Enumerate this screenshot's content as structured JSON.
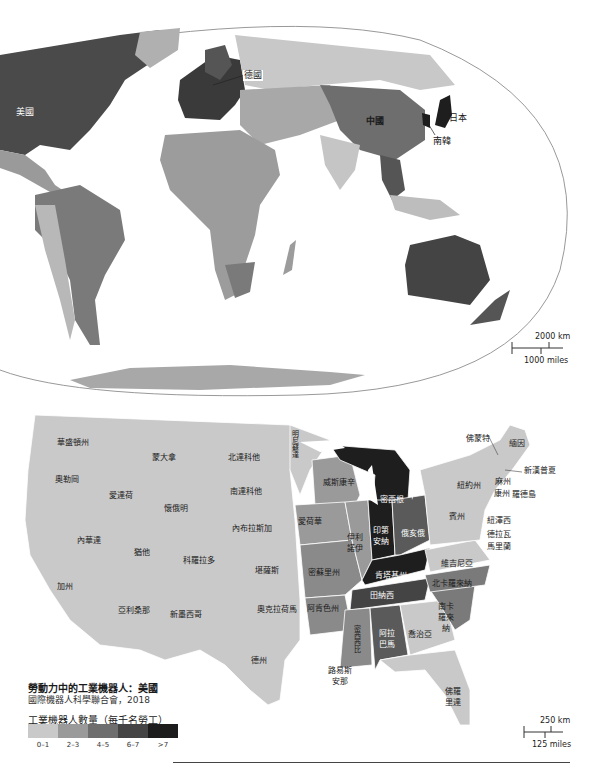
{
  "world_map": {
    "labels": {
      "usa": "美國",
      "germany": "德國",
      "china": "中國",
      "japan": "日本",
      "south_korea": "南韓"
    },
    "scale": {
      "km": "2000 km",
      "miles": "1000 miles"
    }
  },
  "us_map": {
    "states": {
      "washington": "華盛頓州",
      "oregon": "奧勒岡",
      "idaho": "愛達荷",
      "montana": "蒙大拿",
      "wyoming": "懷俄明",
      "nevada": "內華達",
      "utah": "猶他",
      "colorado": "科羅拉多",
      "california": "加州",
      "arizona": "亞利桑那",
      "new_mexico": "新墨西哥",
      "north_dakota": "北達科他",
      "south_dakota": "南達科他",
      "nebraska": "內布拉斯加",
      "kansas": "堪薩斯",
      "oklahoma": "奧克拉荷馬",
      "texas": "德州",
      "minnesota": "明尼蘇達",
      "iowa": "愛荷華",
      "missouri": "密蘇里州",
      "arkansas": "阿肯色州",
      "louisiana": "路易斯安那",
      "wisconsin": "威斯康辛",
      "illinois": "伊利諾伊",
      "michigan": "密西根",
      "indiana": "印第安納",
      "ohio": "俄亥俄",
      "kentucky": "肯塔基州",
      "tennessee": "田納西",
      "mississippi": "密西西比",
      "alabama": "阿拉巴馬",
      "georgia": "喬治亞",
      "florida": "佛羅里達",
      "south_carolina": "南卡羅來納",
      "north_carolina": "北卡羅來納",
      "virginia": "維吉尼亞",
      "pennsylvania": "賓州",
      "new_york": "紐約州",
      "vermont": "佛蒙特",
      "maine": "緬因",
      "new_hampshire": "新漢普夏",
      "massachusetts": "麻州",
      "connecticut": "康州",
      "rhode_island": "羅德島",
      "new_jersey": "紐澤西",
      "delaware": "德拉瓦",
      "maryland": "馬里蘭"
    },
    "scale": {
      "km": "250 km",
      "miles": "125 miles"
    }
  },
  "legend": {
    "title": "勞動力中的工業機器人：美國",
    "source": "國際機器人科學聯合會，2018",
    "caption": "工業機器人數量（每千名勞工）",
    "bins": [
      {
        "label": "0–1",
        "color": "#c9c9c9"
      },
      {
        "label": "2–3",
        "color": "#9a9a9a"
      },
      {
        "label": "4–5",
        "color": "#6e6e6e"
      },
      {
        "label": "6–7",
        "color": "#444444"
      },
      {
        "label": ">7",
        "color": "#1c1c1c"
      }
    ]
  },
  "colors": {
    "c0": "#c9c9c9",
    "c1": "#a5a5a5",
    "c2": "#7a7a7a",
    "c3": "#4d4d4d",
    "c4": "#1e1e1e",
    "ocean": "#ffffff",
    "border": "#ffffff"
  }
}
